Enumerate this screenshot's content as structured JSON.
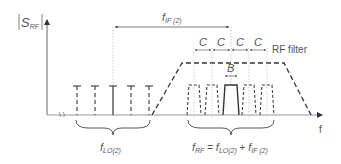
{
  "colors": {
    "line": "#444444",
    "axis": "#888888",
    "dotted": "#aaaaaa",
    "text": "#555555",
    "background": "#ffffff"
  },
  "labels": {
    "y_axis": "|S",
    "y_axis_sub": "RF",
    "y_axis_end": "|",
    "x_axis": "f",
    "f_if": "f",
    "f_if_sub": "IF (2)",
    "c_label": "C",
    "b_label": "B",
    "rf_filter": "RF filter",
    "f_lo": "f",
    "f_lo_sub": "LO(2)",
    "f_rf_eq": {
      "f1": "f",
      "f1_sub": "RF",
      "eq": " = ",
      "f2": "f",
      "f2_sub": "LO(2)",
      "plus": " + ",
      "f3": "f",
      "f3_sub": "IF (2)"
    }
  },
  "geometry": {
    "y_axis_x": 47,
    "baseline_y": 115,
    "y_axis_top": 17,
    "x_axis_end": 326,
    "lo_lines": [
      {
        "x": 77,
        "style": "dashed"
      },
      {
        "x": 95,
        "style": "dashed"
      },
      {
        "x": 113,
        "style": "solid"
      },
      {
        "x": 131,
        "style": "dashed"
      },
      {
        "x": 149,
        "style": "dashed"
      }
    ],
    "lo_top": 86,
    "rf_channels": [
      {
        "cx": 194,
        "style": "dashed"
      },
      {
        "cx": 212,
        "style": "dashed"
      },
      {
        "cx": 231,
        "style": "solid"
      },
      {
        "cx": 249,
        "style": "dashed"
      },
      {
        "cx": 267,
        "style": "dashed"
      }
    ],
    "rf_top": 85,
    "filter": {
      "x_left_base": 152,
      "x_left_top": 182,
      "x_right_top": 284,
      "x_right_base": 311,
      "y_top": 63
    },
    "c_markers_y": 50,
    "if_arrow_y": 27
  }
}
